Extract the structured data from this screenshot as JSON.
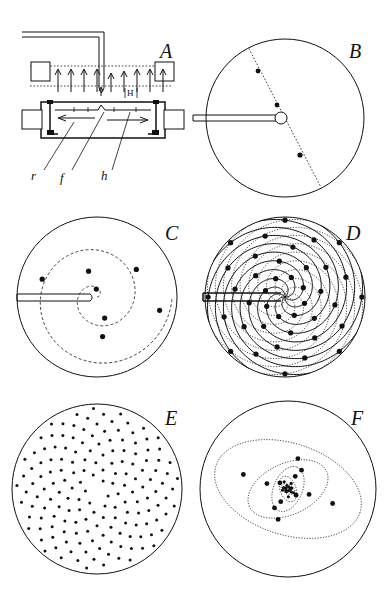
{
  "figure": {
    "background_color": "#ffffff",
    "ink_color": "#111111",
    "width": 386,
    "height": 594
  },
  "panels": [
    {
      "id": "A",
      "label": "A",
      "label_pos": [
        166,
        52
      ],
      "type": "apparatus-schematic",
      "description": "Side view of magnetic ferrofluid apparatus with vertical field arrows",
      "parts": [
        {
          "key": "r",
          "label": "r",
          "label_pos": [
            37,
            176
          ],
          "leader_to": [
            72,
            124
          ]
        },
        {
          "key": "f",
          "label": "f",
          "label_pos": [
            66,
            178
          ],
          "leader_to": [
            104,
            112
          ]
        },
        {
          "key": "h",
          "label": "h",
          "label_pos": [
            106,
            176
          ],
          "leader_to": [
            129,
            112
          ]
        },
        {
          "key": "H",
          "label": "H",
          "label_pos": [
            131,
            94
          ],
          "leader_to": null
        }
      ],
      "field_arrow_count": 9,
      "field_label": "H"
    },
    {
      "id": "B",
      "label": "B",
      "label_pos": [
        355,
        52
      ],
      "type": "disc-single-line",
      "description": "Disc with single dotted diameter line and three droplets",
      "center": [
        285,
        118
      ],
      "radius": 79,
      "line_angle_deg": -62,
      "dots": [
        {
          "r": 0.66,
          "theta_deg": 118
        },
        {
          "r": 0.17,
          "theta_deg": 118
        },
        {
          "r": 0.38,
          "theta_deg": -62
        },
        {
          "r": 0.97,
          "theta_deg": -62
        }
      ]
    },
    {
      "id": "C",
      "label": "C",
      "label_pos": [
        170,
        232
      ],
      "type": "disc-archimedean-spiral",
      "description": "Disc with a single dashed Archimedean spiral carrying six droplets",
      "center": [
        97,
        297
      ],
      "radius": 80,
      "spiral_turns": 2.0,
      "spiral_b": 0.94,
      "dots": [
        {
          "r": 0.1,
          "theta_deg": 95
        },
        {
          "r": 0.28,
          "theta_deg": -70
        },
        {
          "r": 0.34,
          "theta_deg": 108
        },
        {
          "r": 0.5,
          "theta_deg": -82
        },
        {
          "r": 0.6,
          "theta_deg": 35
        },
        {
          "r": 0.72,
          "theta_deg": 162
        },
        {
          "r": 0.8,
          "theta_deg": -12
        }
      ]
    },
    {
      "id": "D",
      "label": "D",
      "label_pos": [
        352,
        232
      ],
      "type": "disc-multi-spiral",
      "description": "Disc with many interleaved spiral arms (parastichies) and droplets at nodes",
      "center": [
        285,
        297
      ],
      "radius": 80,
      "arm_count": 8,
      "spiral_turns": 1.05,
      "dot_rings": 5
    },
    {
      "id": "E",
      "label": "E",
      "label_pos": [
        170,
        417
      ],
      "type": "disc-phyllotaxis-dots",
      "description": "Disc filled with phyllotactic dot pattern, golden-angle divergence",
      "center": [
        97,
        489
      ],
      "radius": 85,
      "dot_count": 165,
      "divergence_angle_deg": 137.5,
      "dot_radius_px": 1.5
    },
    {
      "id": "F",
      "label": "F",
      "label_pos": [
        357,
        417
      ],
      "type": "disc-nested-ellipses",
      "description": "Disc with nested self-similar rotating dotted ellipses and droplets",
      "center": [
        288,
        489
      ],
      "radius": 88,
      "ellipse_count": 6,
      "scale_ratio": 0.56,
      "rotation_step_deg": 137.5,
      "dot_count": 14
    }
  ],
  "legend": {
    "r_meaning": "r",
    "f_meaning": "f",
    "h_meaning": "h",
    "H_meaning": "H"
  }
}
